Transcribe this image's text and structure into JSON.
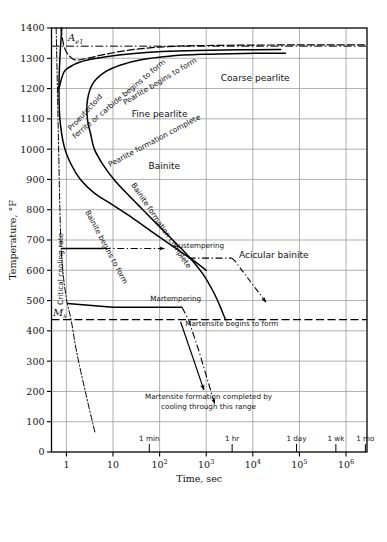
{
  "figure": {
    "type": "ttt-diagram",
    "title_visible": false
  },
  "axes": {
    "y": {
      "label": "Temperature, °F",
      "ticks": [
        0,
        100,
        200,
        300,
        400,
        500,
        600,
        700,
        800,
        900,
        1000,
        1100,
        1200,
        1300,
        1400
      ],
      "min": 0,
      "max": 1400
    },
    "x": {
      "label": "Time, sec",
      "scale": "log10",
      "tick_mantissa": [
        "1",
        "10",
        "10",
        "10",
        "10",
        "10",
        "10"
      ],
      "tick_exponent": [
        "",
        "",
        "2",
        "3",
        "4",
        "5",
        "6"
      ],
      "decades": [
        0,
        1,
        2,
        3,
        4,
        5,
        6
      ],
      "min_decade": -0.32,
      "max_decade": 6.45
    }
  },
  "time_markers": [
    {
      "label": "1 min",
      "decade": 1.778
    },
    {
      "label": "1 hr",
      "decade": 3.556
    },
    {
      "label": "1 day",
      "decade": 4.937
    },
    {
      "label": "1 wk",
      "decade": 5.782
    },
    {
      "label": "1 mo",
      "decade": 6.415
    }
  ],
  "horizontal_markers": [
    {
      "name": "Ae1",
      "base": "A",
      "sub": "e1",
      "temp": 1340
    },
    {
      "name": "Ms",
      "base": "M",
      "sub": "s",
      "temp": 437
    }
  ],
  "region_labels": [
    {
      "text": "Coarse pearlite",
      "decade": 4.05,
      "temp": 1225
    },
    {
      "text": "Fine pearlite",
      "decade": 2.0,
      "temp": 1105
    },
    {
      "text": "Bainite",
      "decade": 2.1,
      "temp": 935
    },
    {
      "text": "Acicular bainite",
      "decade": 4.45,
      "temp": 640
    }
  ],
  "curve_labels": [
    {
      "text": "Proeutectoid",
      "line2": "ferrite or carbide begins to form"
    },
    {
      "text": "Pearlite begins to form"
    },
    {
      "text": "Pearlite formation complete"
    },
    {
      "text": "Bainite begins to form"
    },
    {
      "text": "Bainite formation complete"
    },
    {
      "text": "Critical cooling rate"
    }
  ],
  "annotations": [
    {
      "text": "Austempering",
      "decade": 2.3,
      "temp": 672
    },
    {
      "text": "Martempering",
      "decade": 1.8,
      "temp": 500
    },
    {
      "text": "Martensite begins to form",
      "decade": 2.55,
      "temp": 415
    },
    {
      "text": "Martensite formation completed by",
      "decade": 3.05,
      "temp": 175
    },
    {
      "text": "cooling through this range",
      "decade": 3.05,
      "temp": 143
    }
  ],
  "colors": {
    "curve": "#000000",
    "grid": "#9a9a9a",
    "axis": "#000000",
    "background": "#ffffff"
  },
  "chart_data": {
    "type": "line",
    "title": "",
    "xlabel": "Time, sec",
    "ylabel": "Temperature, °F",
    "ylim": [
      0,
      1400
    ],
    "xlim_decades": [
      -0.32,
      6.45
    ],
    "grid": true,
    "legend": "none",
    "series": [
      {
        "name": "Proeutectoid ferrite or carbide begins to form",
        "style": "dashed",
        "points_decade_temp": [
          [
            -0.12,
            1400
          ],
          [
            -0.06,
            1345
          ],
          [
            0.02,
            1316
          ],
          [
            0.18,
            1295
          ],
          [
            0.45,
            1300
          ],
          [
            0.8,
            1312
          ],
          [
            1.3,
            1326
          ],
          [
            1.9,
            1336
          ],
          [
            2.6,
            1341
          ],
          [
            3.5,
            1343
          ],
          [
            4.6,
            1344
          ],
          [
            5.6,
            1344
          ],
          [
            6.45,
            1344
          ]
        ]
      },
      {
        "name": "Pearlite begins to form",
        "style": "solid",
        "points_decade_temp": [
          [
            -0.1,
            1400
          ],
          [
            -0.14,
            1300
          ],
          [
            -0.16,
            1200
          ],
          [
            -0.14,
            1100
          ],
          [
            -0.05,
            1010
          ],
          [
            0.1,
            950
          ],
          [
            0.3,
            900
          ],
          [
            0.6,
            855
          ],
          [
            1.0,
            815
          ],
          [
            1.4,
            775
          ],
          [
            1.9,
            720
          ],
          [
            2.35,
            672
          ],
          [
            2.7,
            635
          ],
          [
            3.0,
            600
          ]
        ]
      },
      {
        "name": "Pearlite transformation upper branch (to coarse pearlite)",
        "style": "solid",
        "points_decade_temp": [
          [
            -0.16,
            1200
          ],
          [
            -0.05,
            1255
          ],
          [
            0.15,
            1278
          ],
          [
            0.45,
            1294
          ],
          [
            0.85,
            1305
          ],
          [
            1.4,
            1315
          ],
          [
            2.05,
            1322
          ],
          [
            2.8,
            1326
          ],
          [
            3.7,
            1328
          ],
          [
            4.6,
            1329
          ]
        ]
      },
      {
        "name": "Pearlite formation complete",
        "style": "solid",
        "points_decade_temp": [
          [
            0.52,
            1050
          ],
          [
            0.45,
            1100
          ],
          [
            0.45,
            1160
          ],
          [
            0.56,
            1215
          ],
          [
            0.8,
            1252
          ],
          [
            1.15,
            1277
          ],
          [
            1.6,
            1295
          ],
          [
            2.2,
            1307
          ],
          [
            2.9,
            1313
          ],
          [
            3.8,
            1316
          ],
          [
            4.7,
            1317
          ]
        ]
      },
      {
        "name": "Bainite formation complete",
        "style": "solid",
        "points_decade_temp": [
          [
            0.52,
            1050
          ],
          [
            0.6,
            1000
          ],
          [
            0.78,
            950
          ],
          [
            1.02,
            900
          ],
          [
            1.32,
            850
          ],
          [
            1.64,
            800
          ],
          [
            1.96,
            750
          ],
          [
            2.28,
            700
          ],
          [
            2.6,
            650
          ],
          [
            2.92,
            590
          ],
          [
            3.15,
            530
          ],
          [
            3.3,
            480
          ],
          [
            3.38,
            450
          ],
          [
            3.42,
            437
          ]
        ]
      },
      {
        "name": "Martensite begins to form (Ms)",
        "style": "dashed-horizontal",
        "temp": 437
      },
      {
        "name": "Critical cooling rate",
        "style": "dash-dot",
        "points_decade_temp": [
          [
            -0.22,
            1400
          ],
          [
            -0.2,
            1250
          ],
          [
            -0.18,
            1100
          ],
          [
            -0.16,
            950
          ],
          [
            -0.14,
            800
          ],
          [
            -0.12,
            700
          ],
          [
            -0.1,
            640
          ],
          [
            -0.05,
            560
          ],
          [
            0.02,
            490
          ],
          [
            0.1,
            437
          ],
          [
            0.22,
            330
          ],
          [
            0.42,
            190
          ],
          [
            0.62,
            60
          ]
        ]
      },
      {
        "name": "Austempering cooling path",
        "style": "path-solid-then-dashdot",
        "solid_points": [
          [
            -0.11,
            672
          ],
          [
            0.8,
            672
          ]
        ],
        "dashdot_points": [
          [
            0.8,
            672
          ],
          [
            2.05,
            672
          ]
        ],
        "arrow_at": [
          2.1,
          672
        ]
      },
      {
        "name": "Martempering cooling path",
        "style": "path-dashdot",
        "points_decade_temp": [
          [
            0.02,
            490
          ],
          [
            1.0,
            478
          ],
          [
            2.48,
            478
          ],
          [
            2.62,
            437
          ],
          [
            2.85,
            330
          ],
          [
            3.15,
            170
          ]
        ],
        "arrow_at": [
          3.18,
          160
        ]
      },
      {
        "name": "Acicular bainite leader",
        "style": "dashdot-leader",
        "points_decade_temp": [
          [
            2.62,
            640
          ],
          [
            3.55,
            640
          ],
          [
            3.62,
            630
          ],
          [
            4.25,
            500
          ]
        ],
        "arrow_at": [
          4.28,
          495
        ]
      },
      {
        "name": "Ae1 equilibrium line",
        "style": "dash-dot-horizontal",
        "temp": 1340
      }
    ]
  }
}
